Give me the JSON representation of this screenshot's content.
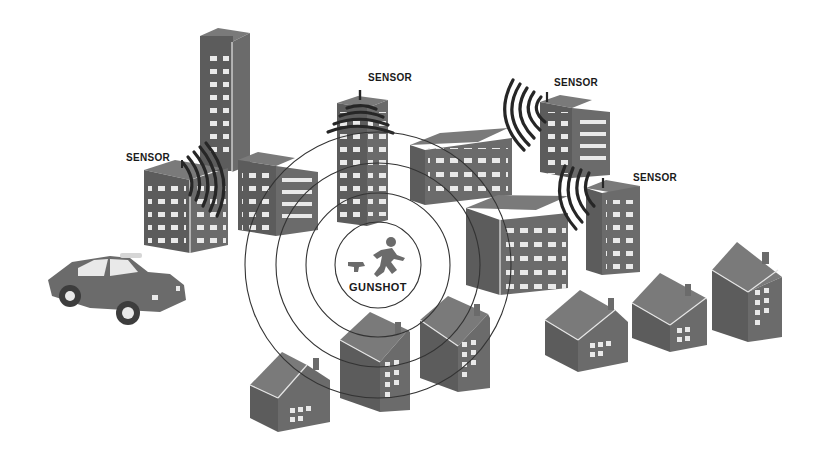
{
  "diagram": {
    "labels": {
      "sensor_1": "SENSOR",
      "sensor_2": "SENSOR",
      "sensor_3": "SENSOR",
      "sensor_4": "SENSOR",
      "gunshot": "GUNSHOT"
    },
    "icons": {
      "center": [
        "running-person-icon",
        "handgun-icon"
      ],
      "vehicle": "police-car-icon",
      "buildings": "apartment-building-icon",
      "houses": "house-icon",
      "signal": "sound-wave-icon"
    },
    "rings": {
      "count": 4,
      "center": [
        378,
        265
      ],
      "radii": [
        43,
        72,
        102,
        133
      ]
    },
    "colors": {
      "building_fill": "#6b6b6b",
      "window_fill": "#e9e9e9",
      "wave_stroke": "#262626",
      "ring_stroke": "#333333",
      "background": "#ffffff"
    }
  }
}
